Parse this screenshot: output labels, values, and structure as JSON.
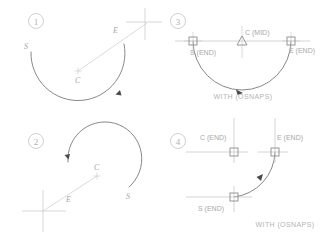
{
  "figure": {
    "background_color": "#ffffff",
    "geometry_color": "#6f6f6f",
    "construction_color": "#c9c9c9",
    "label_color": "#a9a9a9",
    "caption_color": "#b4b4b4",
    "marker_color": "#9a9a9a"
  },
  "panels": [
    {
      "id": "panel-1",
      "number": "1",
      "caption": "",
      "labels": [
        {
          "name": "start-label",
          "text": "S"
        },
        {
          "name": "end-label",
          "text": "E"
        },
        {
          "name": "center-label",
          "text": "C"
        }
      ],
      "has_crosshair": true,
      "arc_direction": "clockwise"
    },
    {
      "id": "panel-2",
      "number": "2",
      "caption": "",
      "labels": [
        {
          "name": "start-label",
          "text": "S"
        },
        {
          "name": "end-label",
          "text": "E"
        },
        {
          "name": "center-label",
          "text": "C"
        }
      ],
      "has_crosshair": true,
      "arc_direction": "counterclockwise"
    },
    {
      "id": "panel-3",
      "number": "3",
      "caption": "WITH  (OSNAPS)",
      "labels": [
        {
          "name": "start-label",
          "text": "S (END)"
        },
        {
          "name": "center-label",
          "text": "C (MID)"
        },
        {
          "name": "end-label",
          "text": "E (END)"
        }
      ],
      "snap_markers": [
        {
          "name": "endpoint-snap-marker-start",
          "shape": "square",
          "snap": "END"
        },
        {
          "name": "midpoint-snap-marker-center",
          "shape": "triangle",
          "snap": "MID"
        },
        {
          "name": "endpoint-snap-marker-end",
          "shape": "square",
          "snap": "END"
        }
      ],
      "has_crosshair": true,
      "arc_direction": "clockwise"
    },
    {
      "id": "panel-4",
      "number": "4",
      "caption": "WITH  (OSNAPS)",
      "labels": [
        {
          "name": "center-label",
          "text": "C (END)"
        },
        {
          "name": "end-label",
          "text": "E (END)"
        },
        {
          "name": "start-label",
          "text": "S (END)"
        }
      ],
      "snap_markers": [
        {
          "name": "endpoint-snap-marker-center",
          "shape": "square",
          "snap": "END"
        },
        {
          "name": "endpoint-snap-marker-end",
          "shape": "square",
          "snap": "END"
        },
        {
          "name": "endpoint-snap-marker-start",
          "shape": "square",
          "snap": "END"
        }
      ],
      "has_crosshair": true,
      "arc_direction": "counterclockwise"
    }
  ]
}
